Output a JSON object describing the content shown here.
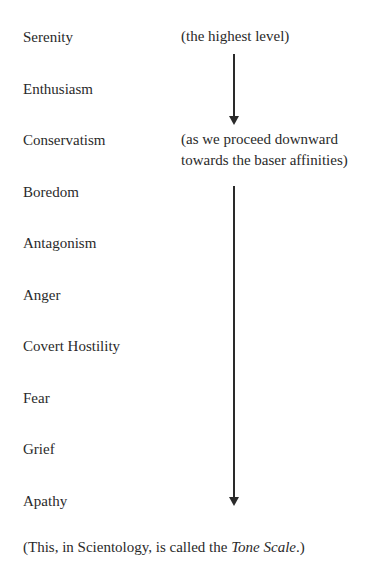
{
  "scale": {
    "levels": [
      {
        "label": "Serenity",
        "top": 28
      },
      {
        "label": "Enthusiasm",
        "top": 80
      },
      {
        "label": "Conservatism",
        "top": 131
      },
      {
        "label": "Boredom",
        "top": 183
      },
      {
        "label": "Antagonism",
        "top": 234
      },
      {
        "label": "Anger",
        "top": 286
      },
      {
        "label": "Covert Hostility",
        "top": 337
      },
      {
        "label": "Fear",
        "top": 389
      },
      {
        "label": "Grief",
        "top": 440
      },
      {
        "label": "Apathy",
        "top": 492
      }
    ],
    "notes": {
      "top_note": "(the highest level)",
      "middle_note_line1": "(as we proceed downward",
      "middle_note_line2": "towards the baser affinities)"
    },
    "arrows": [
      {
        "from_y": 54,
        "to_y": 118,
        "x": 233
      },
      {
        "from_y": 186,
        "to_y": 499,
        "x": 233
      }
    ]
  },
  "footer": {
    "prefix": "(This, in Scientology, is called the ",
    "term": "Tone Scale",
    "suffix": ".)"
  }
}
